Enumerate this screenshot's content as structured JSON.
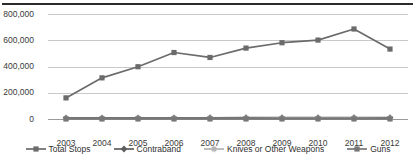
{
  "chart_data": {
    "type": "line",
    "title": "",
    "xlabel": "",
    "ylabel": "",
    "grid": true,
    "legend_position": "bottom",
    "categories": [
      "2003",
      "2004",
      "2005",
      "2006",
      "2007",
      "2008",
      "2009",
      "2010",
      "2011",
      "2012"
    ],
    "ylim": [
      0,
      800000
    ],
    "yticks": [
      0,
      200000,
      400000,
      600000,
      800000
    ],
    "ytick_labels": [
      "0",
      "200,000",
      "400,000",
      "600,000",
      "800,000"
    ],
    "series": [
      {
        "name": "Total Stops",
        "color": "#6b6b6b",
        "marker": "square",
        "values": [
          160851,
          313523,
          398191,
          506491,
          468932,
          540302,
          581168,
          601285,
          685724,
          532911
        ]
      },
      {
        "name": "Contraband",
        "color": "#5f5f5f",
        "marker": "diamond",
        "values": [
          8000,
          8500,
          8800,
          9200,
          9500,
          9800,
          10000,
          10200,
          10500,
          9800
        ]
      },
      {
        "name": "Knives or Other Weapons",
        "color": "#b4b4b4",
        "marker": "asterisk",
        "values": [
          3500,
          3600,
          3700,
          3800,
          3900,
          4000,
          4100,
          4200,
          4300,
          4000
        ]
      },
      {
        "name": "Guns",
        "color": "#777777",
        "marker": "square",
        "values": [
          600,
          650,
          700,
          750,
          800,
          820,
          800,
          780,
          760,
          700
        ]
      }
    ]
  },
  "legend": {
    "items": [
      {
        "label": "Total Stops",
        "marker": "square",
        "color": "#6b6b6b"
      },
      {
        "label": "Contraband",
        "marker": "diamond",
        "color": "#5f5f5f"
      },
      {
        "label": "Knives or Other Weapons",
        "marker": "asterisk",
        "color": "#b4b4b4"
      },
      {
        "label": "Guns",
        "marker": "square",
        "color": "#777777"
      }
    ]
  }
}
